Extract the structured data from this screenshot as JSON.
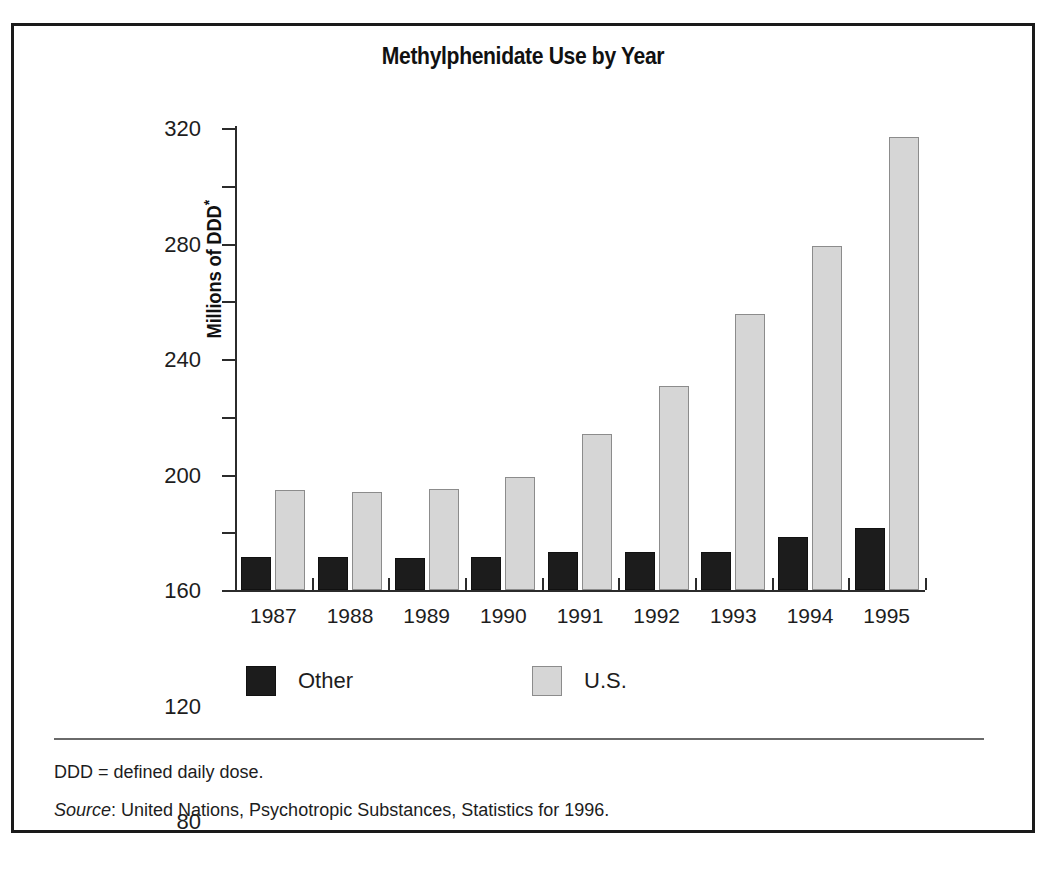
{
  "figure": {
    "title": "Methylphenidate Use by Year",
    "footnotes": {
      "ddd": "DDD = defined daily dose.",
      "source_word": "Source",
      "source_rest": ": United Nations, Psychotropic Substances, Statistics for 1996."
    }
  },
  "chart_data": {
    "type": "bar",
    "title": "Methylphenidate Use by Year",
    "xlabel": "",
    "ylabel": "Millions of DDD*",
    "ylim": [
      0,
      320
    ],
    "ytick_labels": [
      "0",
      "40",
      "80",
      "120",
      "160",
      "200",
      "240",
      "280",
      "320"
    ],
    "ytick_values": [
      0,
      40,
      80,
      120,
      160,
      200,
      240,
      280,
      320
    ],
    "grid": false,
    "legend_position": "bottom",
    "categories": [
      "1987",
      "1988",
      "1989",
      "1990",
      "1991",
      "1992",
      "1993",
      "1994",
      "1995"
    ],
    "series": [
      {
        "name": "Other",
        "color": "#1c1c1c",
        "values": [
          23,
          23,
          22,
          23,
          26,
          26,
          26,
          37,
          43
        ]
      },
      {
        "name": "U.S.",
        "color": "#d6d6d6",
        "values": [
          69,
          68,
          70,
          78,
          108,
          141,
          191,
          238,
          314
        ]
      }
    ]
  }
}
